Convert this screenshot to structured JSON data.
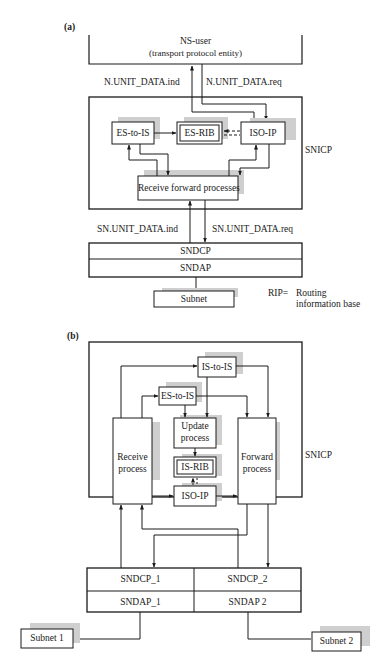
{
  "part_a": {
    "label": "(a)",
    "ns_user": "NS-user",
    "ns_user_sub": "(transport protocol entity)",
    "n_ind": "N.UNIT_DATA.ind",
    "n_req": "N.UNIT_DATA.req",
    "es_to_is": "ES-to-IS",
    "es_rib": "ES-RIB",
    "iso_ip": "ISO-IP",
    "receive_forward": "Receive forward processes",
    "snicp": "SNICP",
    "sn_ind": "SN.UNIT_DATA.ind",
    "sn_req": "SN.UNIT_DATA.req",
    "sndcp": "SNDCP",
    "sndap": "SNDAP",
    "subnet": "Subnet",
    "rip_key": "RIP=",
    "rip_def1": "Routing",
    "rip_def2": "information base"
  },
  "part_b": {
    "label": "(b)",
    "is_to_is": "IS-to-IS",
    "es_to_is": "ES-to-IS",
    "update1": "Update",
    "update2": "process",
    "receive1": "Receive",
    "receive2": "process",
    "forward1": "Forward",
    "forward2": "process",
    "is_rib": "IS-RIB",
    "iso_ip": "ISO-IP",
    "snicp": "SNICP",
    "sndcp_1": "SNDCP_1",
    "sndcp_2": "SNDCP_2",
    "sndap_1": "SNDAP_1",
    "sndap_2": "SNDAP 2",
    "subnet_1": "Subnet 1",
    "subnet_2": "Subnet 2"
  }
}
